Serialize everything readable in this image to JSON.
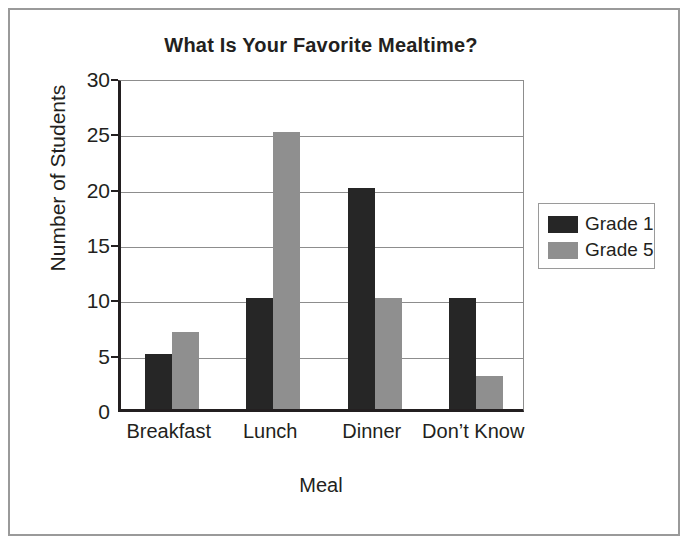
{
  "frame": {
    "border_color": "#9a9a9a"
  },
  "chart_data": {
    "type": "bar",
    "title": "What Is Your Favorite Mealtime?",
    "xlabel": "Meal",
    "ylabel": "Number of Students",
    "categories": [
      "Breakfast",
      "Lunch",
      "Dinner",
      "Don’t Know"
    ],
    "series": [
      {
        "name": "Grade 1",
        "color": "#262626",
        "values": [
          5,
          10,
          20,
          10
        ]
      },
      {
        "name": "Grade 5",
        "color": "#8f8f8f",
        "values": [
          7,
          25,
          10,
          3
        ]
      }
    ],
    "ylim": [
      0,
      30
    ],
    "yticks": [
      0,
      5,
      10,
      15,
      20,
      25,
      30
    ],
    "ytick_labels": [
      "0",
      "5",
      "10",
      "15",
      "20",
      "25",
      "30"
    ],
    "grid": true,
    "grid_axis": "y",
    "legend_position": "right-outside",
    "legend_entries": [
      "Grade 1",
      "Grade 5"
    ]
  }
}
